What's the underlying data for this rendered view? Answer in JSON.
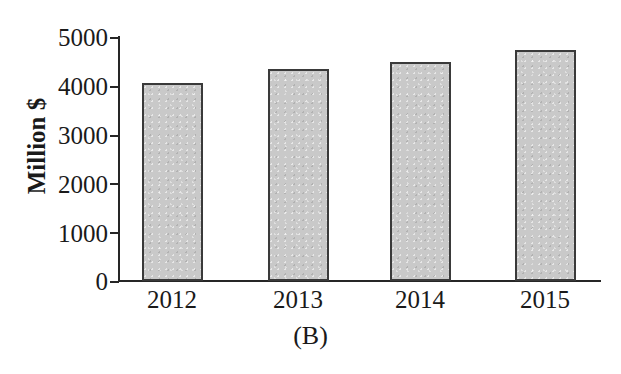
{
  "figure": {
    "caption": "(B)",
    "background_color": "#ffffff",
    "axis_color": "#262626",
    "bar_fill_color": "#c9c9c9",
    "bar_edge_color": "#3a3a3a"
  },
  "chart_data": {
    "type": "bar",
    "title": "",
    "subtitle": "",
    "caption": "(B)",
    "xlabel": "",
    "ylabel": "Million $",
    "categories": [
      "2012",
      "2013",
      "2014",
      "2015"
    ],
    "values": [
      4050,
      4350,
      4480,
      4740
    ],
    "ylim": [
      0,
      5000
    ],
    "yticks": [
      0,
      1000,
      2000,
      3000,
      4000,
      5000
    ],
    "ytick_labels": [
      "0",
      "1000",
      "2000",
      "3000",
      "4000",
      "5000"
    ],
    "xtick_labels": [
      "2012",
      "2013",
      "2014",
      "2015"
    ],
    "grid": false,
    "legend": null,
    "legend_position": "none",
    "series": [
      {
        "name": "Million $",
        "values": [
          4050,
          4350,
          4480,
          4740
        ]
      }
    ],
    "annotations": []
  }
}
